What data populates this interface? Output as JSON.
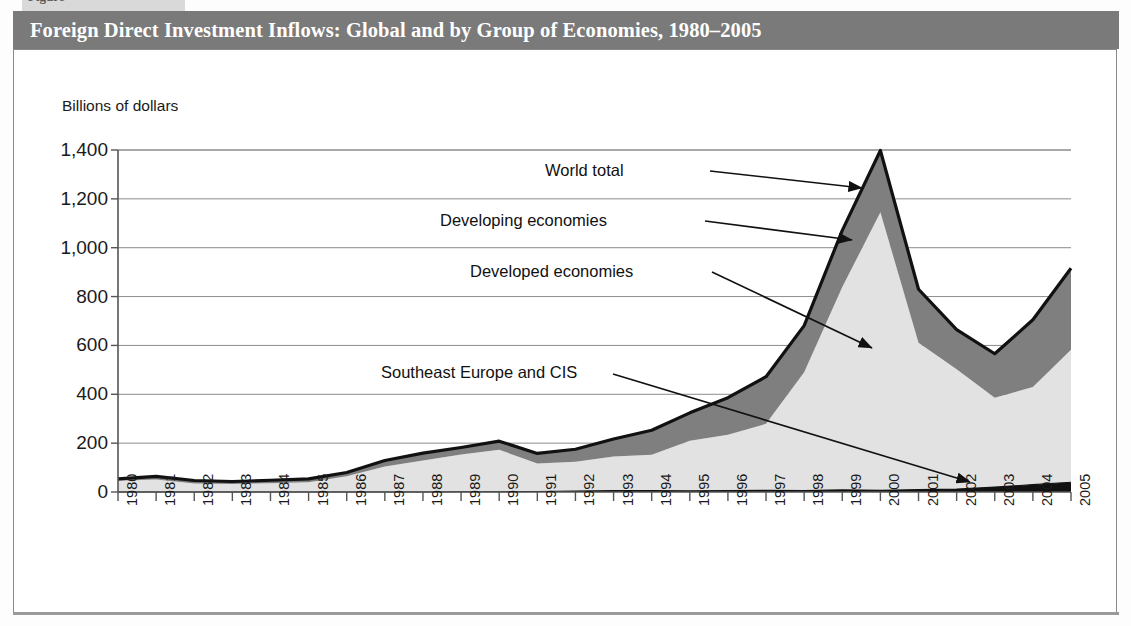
{
  "figure": {
    "tab_fragment": "Figure",
    "title": "Foreign Direct Investment Inflows: Global and by Group of Economies, 1980–2005"
  },
  "colors": {
    "title_bar": "#7a7a7a",
    "frame_border": "#8a8a8a",
    "developed": "#e2e2e2",
    "developing": "#7f7f7f",
    "southeast_europe_cis": "#111111",
    "gridline": "#8c8c8c",
    "outline": "#111111"
  },
  "chart_data": {
    "type": "area",
    "title": "Foreign Direct Investment Inflows: Global and by Group of Economies, 1980–2005",
    "subtitle": "",
    "xlabel": "",
    "ylabel": "Billions of dollars",
    "ylim": [
      0,
      1400
    ],
    "yticks": [
      0,
      200,
      400,
      600,
      800,
      1000,
      1200,
      1400
    ],
    "ytick_labels": [
      "0",
      "200",
      "400",
      "600",
      "800",
      "1,000",
      "1,200",
      "1,400"
    ],
    "grid": true,
    "legend_position": "inline-annotations",
    "stacked": true,
    "stack_order": [
      "Southeast Europe and CIS",
      "Developed economies",
      "Developing economies"
    ],
    "categories": [
      "1980",
      "1981",
      "1982",
      "1983",
      "1984",
      "1985",
      "1986",
      "1987",
      "1988",
      "1989",
      "1990",
      "1991",
      "1992",
      "1993",
      "1994",
      "1995",
      "1996",
      "1997",
      "1998",
      "1999",
      "2000",
      "2001",
      "2002",
      "2003",
      "2004",
      "2005"
    ],
    "series": [
      {
        "name": "Southeast Europe and CIS",
        "color": "#111111",
        "values": [
          0,
          0,
          0,
          0,
          0,
          0,
          0,
          0,
          0,
          1,
          1,
          2,
          4,
          6,
          6,
          5,
          6,
          7,
          6,
          9,
          7,
          10,
          12,
          20,
          30,
          40
        ]
      },
      {
        "name": "Developed economies",
        "color": "#e2e2e2",
        "values": [
          46,
          51,
          35,
          33,
          36,
          40,
          64,
          104,
          129,
          152,
          172,
          115,
          120,
          139,
          146,
          205,
          228,
          272,
          484,
          830,
          1138,
          601,
          490,
          366,
          400,
          542
        ]
      },
      {
        "name": "Developing economies",
        "color": "#7f7f7f",
        "values": [
          8,
          13,
          12,
          10,
          12,
          14,
          16,
          25,
          30,
          29,
          35,
          41,
          51,
          72,
          101,
          114,
          152,
          193,
          191,
          232,
          253,
          219,
          163,
          180,
          275,
          334
        ]
      }
    ],
    "world_total": [
      54,
      64,
      47,
      43,
      48,
      54,
      80,
      129,
      159,
      182,
      208,
      158,
      175,
      217,
      253,
      324,
      386,
      472,
      681,
      1071,
      1398,
      830,
      665,
      566,
      705,
      916
    ],
    "annotations": [
      {
        "text": "World total",
        "target_year": "2000",
        "target_value": 1398
      },
      {
        "text": "Developing economies",
        "target_year": "2000",
        "target_value": 1260
      },
      {
        "text": "Developed economies",
        "target_year": "2000",
        "target_value": 700
      },
      {
        "text": "Southeast Europe and CIS",
        "target_year": "2003",
        "target_value": 25
      }
    ]
  },
  "annotation_labels": {
    "world_total": "World total",
    "developing": "Developing economies",
    "developed": "Developed economies",
    "see_cis": "Southeast Europe and CIS"
  }
}
